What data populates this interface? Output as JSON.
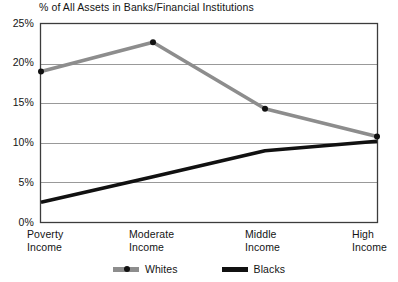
{
  "chart_data": {
    "type": "line",
    "title": "% of All Assets in Banks/Financial Institutions",
    "xlabel": "",
    "ylabel": "",
    "categories": [
      "Poverty Income",
      "Moderate Income",
      "Middle Income",
      "High Income"
    ],
    "category_lines": [
      [
        "Poverty",
        "Income"
      ],
      [
        "Moderate",
        "Income"
      ],
      [
        "Middle",
        "Income"
      ],
      [
        "High",
        "Income"
      ]
    ],
    "ylim": [
      0,
      25
    ],
    "ytick_values": [
      0,
      5,
      10,
      15,
      20,
      25
    ],
    "ytick_labels": [
      "0%",
      "5%",
      "10%",
      "15%",
      "20%",
      "25%"
    ],
    "grid": true,
    "grid_axis": "y",
    "legend_position": "bottom-center",
    "series": [
      {
        "name": "Whites",
        "color": "#8d8d8d",
        "values": [
          19.0,
          22.7,
          14.3,
          10.8
        ],
        "markers": true
      },
      {
        "name": "Blacks",
        "color": "#111111",
        "values": [
          2.5,
          5.7,
          9.0,
          10.2
        ],
        "markers": false
      }
    ]
  },
  "legend": {
    "items": [
      {
        "label": "Whites",
        "color": "#8d8d8d"
      },
      {
        "label": "Blacks",
        "color": "#111111"
      }
    ]
  },
  "axis": {
    "frame_color": "#3c3c3c",
    "grid_color": "#999999"
  }
}
